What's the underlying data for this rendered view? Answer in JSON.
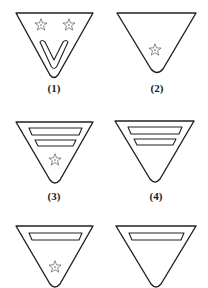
{
  "figure": {
    "badges": [
      {
        "id": 1,
        "label": "(1)",
        "elements": [
          "two stars",
          "chevron V"
        ]
      },
      {
        "id": 2,
        "label": "(2)",
        "elements": [
          "one star"
        ]
      },
      {
        "id": 3,
        "label": "(3)",
        "elements": [
          "two bars",
          "one star"
        ]
      },
      {
        "id": 4,
        "label": "(4)",
        "elements": [
          "two bars"
        ]
      },
      {
        "id": 5,
        "label": "",
        "elements": [
          "one bar",
          "one star"
        ]
      },
      {
        "id": 6,
        "label": "",
        "elements": [
          "one bar"
        ]
      }
    ]
  },
  "labels": {
    "b1": "(1)",
    "b2": "(2)",
    "b3": "(3)",
    "b4": "(4)"
  },
  "colors": {
    "stroke": "#222222",
    "background": "#ffffff"
  }
}
